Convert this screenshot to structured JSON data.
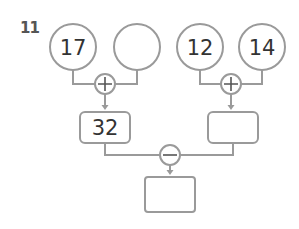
{
  "problem": {
    "number": "11"
  },
  "colors": {
    "stroke": "#9a9a9a",
    "text": "#333333",
    "number_label": "#555555"
  },
  "inputs": [
    {
      "value": "17"
    },
    {
      "value": ""
    },
    {
      "value": "12"
    },
    {
      "value": "14"
    }
  ],
  "operators": {
    "left_top": "+",
    "right_top": "+",
    "bottom": "−"
  },
  "results": {
    "left_sum": "32",
    "right_sum": "",
    "final_difference": ""
  }
}
